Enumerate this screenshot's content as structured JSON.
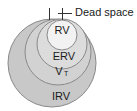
{
  "figure": {
    "background_color": "#ffffff"
  },
  "callout": {
    "label": "Dead space",
    "marker_name": "dead-space-bracket"
  },
  "circles": [
    {
      "id": "irv",
      "label": "IRV",
      "fill": "#c8c8c8",
      "stroke": "#8a8a8a",
      "cx": 52,
      "cy": 63,
      "r": 44,
      "label_x": 61,
      "label_y": 97
    },
    {
      "id": "vt",
      "label": "V",
      "subscript": "T",
      "fill": "#d2d2d2",
      "stroke": "#8a8a8a",
      "cx": 58,
      "cy": 52,
      "r": 33,
      "label_x": 61,
      "label_y": 72
    },
    {
      "id": "erv",
      "label": "ERV",
      "fill": "#dcdcdc",
      "stroke": "#8a8a8a",
      "cx": 62,
      "cy": 44,
      "r": 25,
      "label_x": 64,
      "label_y": 57
    },
    {
      "id": "rv",
      "label": "RV",
      "fill": "#f2f2f2",
      "stroke": "#8a8a8a",
      "cx": 62,
      "cy": 35,
      "r": 15,
      "label_x": 62,
      "label_y": 31
    }
  ],
  "colors": {
    "outline": "#8a8a8a",
    "text": "#1a1a1a",
    "tick": "#333333"
  }
}
